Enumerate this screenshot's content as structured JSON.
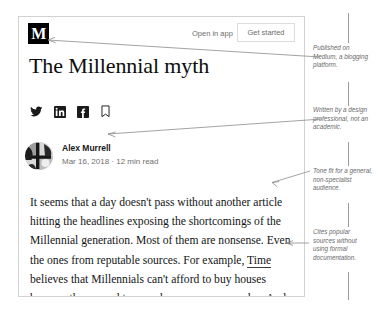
{
  "page": {
    "background_color": "#ffffff",
    "card_border_color": "#d2d2d2"
  },
  "article": {
    "topbar": {
      "logo_text": "M",
      "open_in_app_label": "Open in app",
      "get_started_label": "Get started"
    },
    "headline": "The Millennial myth",
    "social_icons": [
      {
        "name": "twitter-icon",
        "label": "Twitter"
      },
      {
        "name": "linkedin-icon",
        "label": "LinkedIn"
      },
      {
        "name": "facebook-icon",
        "label": "Facebook"
      },
      {
        "name": "bookmark-icon",
        "label": "Bookmark"
      }
    ],
    "byline": {
      "author": "Alex Murrell",
      "meta": "Mar 16, 2018 · 12 min read",
      "date": "Mar 16, 2018",
      "read_time": "12 min read"
    },
    "body": {
      "part1": "It seems that a day doesn't pass without another article hitting the headlines exposing the shortcomings of the Millennial generation. Most of them are nonsense. Even the ones from reputable sources. For example, ",
      "link": "Time",
      "part2": " believes that Millennials can't afford to buy houses because they spend too much money on avocados. And"
    }
  },
  "annotations": [
    {
      "id": "annotation-published-on",
      "text": "Published on Medium, a blogging platform."
    },
    {
      "id": "annotation-author-credential",
      "text": "Written by a design professional, not an academic."
    },
    {
      "id": "annotation-tone",
      "text": "Tone fit for a general, non-specialist audience."
    },
    {
      "id": "annotation-sources",
      "text": "Cites popular sources without using formal documentation."
    }
  ]
}
